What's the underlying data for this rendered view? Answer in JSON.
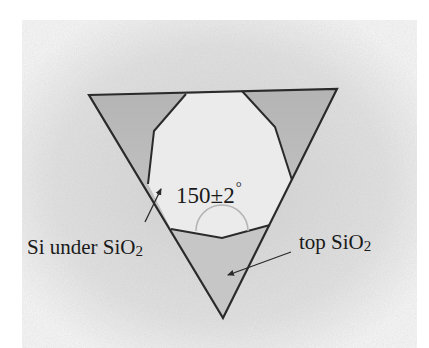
{
  "figure": {
    "angle_label": {
      "value": "150",
      "pm": "±",
      "tolerance": "2",
      "unit": "°"
    },
    "labels": {
      "si_under": {
        "main": "Si under SiO",
        "sub": "2"
      },
      "top_sio2": {
        "main": "top SiO",
        "sub": "2"
      }
    },
    "colors": {
      "page": "#ffffff",
      "background_texture": "#dcdcdc",
      "corner_region": "#bdbdbd",
      "octagon_fill": "#ececec",
      "outline": "#2a2a2a",
      "arc": "#b8b8b8"
    },
    "geometry": {
      "triangle": [
        [
          89,
          95
        ],
        [
          337,
          89
        ],
        [
          223,
          318
        ]
      ],
      "octagon": [
        [
          186,
          94
        ],
        [
          242,
          91
        ],
        [
          275,
          127
        ],
        [
          292,
          180
        ],
        [
          270,
          225
        ],
        [
          222,
          238
        ],
        [
          171,
          229
        ],
        [
          148,
          184
        ],
        [
          154,
          131
        ]
      ],
      "arc_center": [
        222,
        231
      ],
      "arc_radius": 26
    }
  }
}
